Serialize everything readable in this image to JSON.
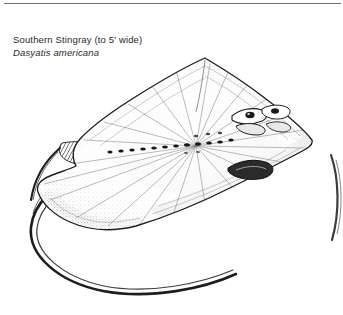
{
  "plate": {
    "label_common": "Southern Stingray (to 5' wide)",
    "label_scientific": "Dasyatis americana",
    "ink_color": "#1d1d1d",
    "stipple_color": "#3a3a3a",
    "paper_color": "#ffffff",
    "rule_color": "#6e6e6e"
  },
  "figure": {
    "view": "dorsal",
    "technique": "stipple-and-line-engraving",
    "body_outline": "M 205 58 L 262 96 L 303 131 L 312 142 L 299 151 L 243 183 L 176 214 L 120 229 L 74 222 L 46 203 L 38 187 L 58 173 L 74 166 L 70 153 L 78 140 L 104 124 L 146 92 Z",
    "features": [
      {
        "name": "left-wing-tip",
        "x": 38,
        "y": 190
      },
      {
        "name": "right-wing-tip",
        "x": 312,
        "y": 142
      },
      {
        "name": "snout-apex",
        "x": 205,
        "y": 58
      },
      {
        "name": "eye-left",
        "x": 243,
        "y": 118
      },
      {
        "name": "eye-right",
        "x": 258,
        "y": 113
      },
      {
        "name": "spiracle",
        "x": 252,
        "y": 127
      },
      {
        "name": "tail-base",
        "x": 78,
        "y": 176
      },
      {
        "name": "tail-tip",
        "x": 236,
        "y": 274
      }
    ],
    "tubercle_row": [
      [
        148,
        148
      ],
      [
        158,
        147
      ],
      [
        168,
        146
      ],
      [
        178,
        145
      ],
      [
        188,
        144
      ],
      [
        198,
        143
      ],
      [
        208,
        142
      ],
      [
        218,
        141
      ],
      [
        228,
        140
      ],
      [
        238,
        139
      ]
    ],
    "tail_path": "M 80 178 C 52 186 34 204 32 228 C 30 256 60 283 104 292 C 152 300 206 288 236 274",
    "partial_figure": {
      "name": "adjacent-plate-fragment",
      "path": "M 330 156 C 338 178 339 212 331 240"
    }
  }
}
